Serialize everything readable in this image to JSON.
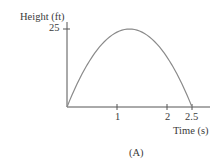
{
  "chart_data": {
    "type": "line",
    "title": "",
    "caption": "(A)",
    "xlabel": "Time (s)",
    "ylabel": "Height (ft)",
    "x_ticks": [
      1,
      2,
      2.5
    ],
    "x_tick_labels": [
      "1",
      "2",
      "2.5"
    ],
    "y_ticks": [
      25
    ],
    "y_tick_labels": [
      "25"
    ],
    "xlim": [
      0,
      2.6
    ],
    "ylim": [
      0,
      27
    ],
    "grid": false,
    "legend": null,
    "series": [
      {
        "name": "height",
        "description": "Parabolic trajectory h(t) = 40t - 16t^2",
        "x": [
          0,
          0.25,
          0.5,
          0.75,
          1.0,
          1.25,
          1.5,
          1.75,
          2.0,
          2.25,
          2.5
        ],
        "y": [
          0,
          9,
          16,
          21,
          24,
          25,
          24,
          21,
          16,
          9,
          0
        ]
      }
    ],
    "annotations": [
      {
        "text": "max height 25 ft at t = 1.25 s"
      }
    ]
  },
  "labels": {
    "ylabel": "Height (ft)",
    "xlabel": "Time (s)",
    "ytick_25": "25",
    "xtick_1": "1",
    "xtick_2": "2",
    "xtick_25": "2.5",
    "caption": "(A)"
  },
  "colors": {
    "axis": "#555555",
    "curve": "#8a8a8a",
    "text": "#3a3a3a"
  }
}
